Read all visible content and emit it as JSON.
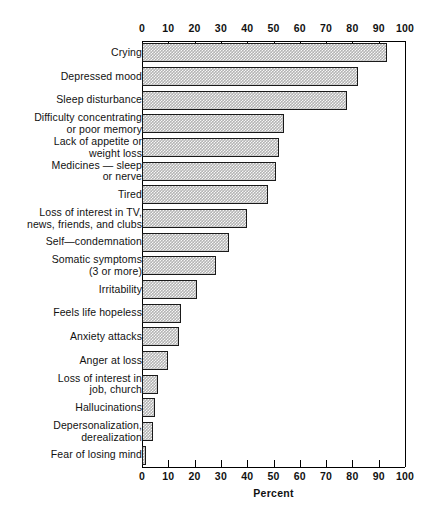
{
  "chart_data": {
    "type": "bar",
    "orientation": "horizontal",
    "title": "",
    "xlabel": "Percent",
    "ylabel": "",
    "xlim": [
      0,
      100
    ],
    "xticks": [
      0,
      10,
      20,
      30,
      40,
      50,
      60,
      70,
      80,
      90,
      100
    ],
    "grid": false,
    "legend": null,
    "axis_positions": [
      "top",
      "bottom"
    ],
    "bar_fill": "#b4b4b4",
    "bar_edge": "#1a1a1a",
    "categories": [
      "Crying",
      "Depressed mood",
      "Sleep disturbance",
      "Difficulty concentrating\nor poor memory",
      "Lack of appetite or\nweight loss",
      "Medicines — sleep\nor nerve",
      "Tired",
      "Loss of interest in TV,\nnews, friends, and clubs",
      "Self—condemnation",
      "Somatic symptoms\n(3 or more)",
      "Irritability",
      "Feels life hopeless",
      "Anxiety attacks",
      "Anger at loss",
      "Loss of interest in\njob, church",
      "Hallucinations",
      "Depersonalization,\nderealization",
      "Fear of losing mind"
    ],
    "values": [
      93,
      82,
      78,
      54,
      52,
      51,
      48,
      40,
      33,
      28,
      21,
      15,
      14,
      10,
      6,
      5,
      4,
      1.5
    ]
  },
  "axis": {
    "tick_labels": [
      "0",
      "10",
      "20",
      "30",
      "40",
      "50",
      "60",
      "70",
      "80",
      "90",
      "100"
    ],
    "xlabel": "Percent"
  }
}
